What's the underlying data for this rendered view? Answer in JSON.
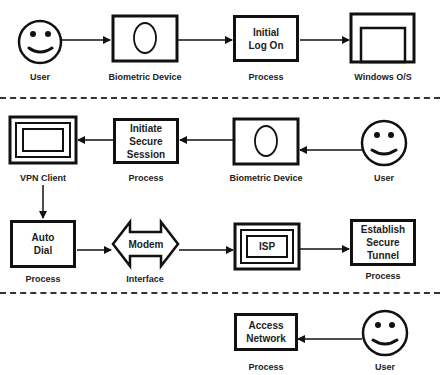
{
  "diagram": {
    "sections": [
      {
        "id": "section-1",
        "nodes": [
          {
            "id": "user-1",
            "shape": "smiley-icon",
            "label": "User"
          },
          {
            "id": "biometric-1",
            "shape": "biometric-device-icon",
            "label": "Biometric Device"
          },
          {
            "id": "initial-logon",
            "shape": "process-box",
            "text": "Initial\nLog On",
            "label": "Process"
          },
          {
            "id": "windows-os",
            "shape": "window-icon",
            "label": "Windows O/S"
          }
        ],
        "edges": [
          {
            "from": "user-1",
            "to": "biometric-1"
          },
          {
            "from": "biometric-1",
            "to": "initial-logon"
          },
          {
            "from": "initial-logon",
            "to": "windows-os"
          }
        ]
      },
      {
        "id": "section-2",
        "nodes": [
          {
            "id": "vpn-client",
            "shape": "nested-window-icon",
            "label": "VPN Client"
          },
          {
            "id": "initiate-session",
            "shape": "process-box",
            "text": "Initiate\nSecure\nSession",
            "label": "Process"
          },
          {
            "id": "biometric-2",
            "shape": "biometric-device-icon",
            "label": "Biometric Device"
          },
          {
            "id": "user-2",
            "shape": "smiley-icon",
            "label": "User"
          },
          {
            "id": "auto-dial",
            "shape": "process-box",
            "text": "Auto\nDial",
            "label": "Process"
          },
          {
            "id": "modem",
            "shape": "double-arrow-interface",
            "text": "Modem",
            "label": "Interface"
          },
          {
            "id": "isp",
            "shape": "nested-box",
            "text": "ISP",
            "label": ""
          },
          {
            "id": "establish-tunnel",
            "shape": "process-box",
            "text": "Establish\nSecure\nTunnel",
            "label": "Process"
          }
        ],
        "edges": [
          {
            "from": "user-2",
            "to": "biometric-2"
          },
          {
            "from": "biometric-2",
            "to": "initiate-session"
          },
          {
            "from": "initiate-session",
            "to": "vpn-client"
          },
          {
            "from": "vpn-client",
            "to": "auto-dial"
          },
          {
            "from": "auto-dial",
            "to": "modem"
          },
          {
            "from": "modem",
            "to": "isp"
          },
          {
            "from": "isp",
            "to": "establish-tunnel"
          }
        ]
      },
      {
        "id": "section-3",
        "nodes": [
          {
            "id": "access-network",
            "shape": "process-box",
            "text": "Access\nNetwork",
            "label": "Process"
          },
          {
            "id": "user-3",
            "shape": "smiley-icon",
            "label": "User"
          }
        ],
        "edges": [
          {
            "from": "user-3",
            "to": "access-network"
          }
        ]
      }
    ]
  },
  "text": {
    "user": "User",
    "biometric_device": "Biometric Device",
    "process": "Process",
    "interface": "Interface",
    "windows_os": "Windows O/S",
    "vpn_client": "VPN Client",
    "initial_logon": "Initial\nLog On",
    "initiate_session": "Initiate\nSecure\nSession",
    "auto_dial": "Auto\nDial",
    "modem": "Modem",
    "isp": "ISP",
    "establish_tunnel": "Establish\nSecure\nTunnel",
    "access_network": "Access\nNetwork"
  },
  "colors": {
    "stroke": "#111111",
    "background": "#ffffff"
  }
}
